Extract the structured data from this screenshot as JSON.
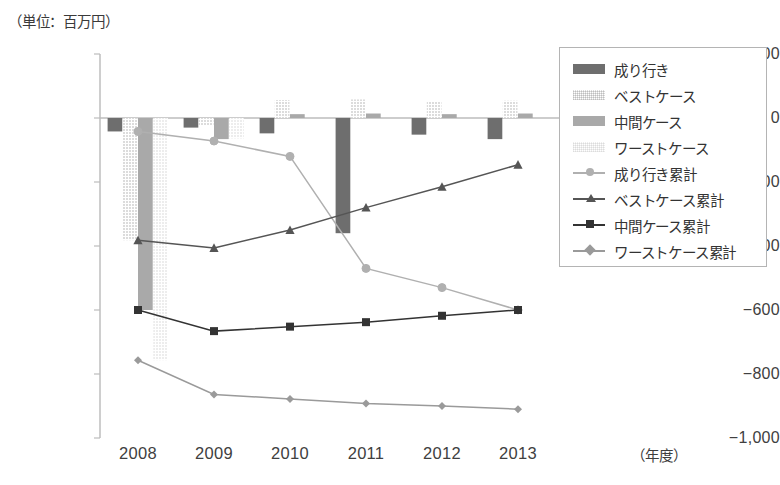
{
  "unit_label": "（単位：百万円）",
  "xaxis_unit": "（年度）",
  "legend": {
    "items": [
      {
        "label": "成り行き",
        "kind": "bar",
        "color": "#6e6e6e",
        "pattern": "solid"
      },
      {
        "label": "ベストケース",
        "kind": "bar",
        "color": "#dcdcdc",
        "pattern": "dotted"
      },
      {
        "label": "中間ケース",
        "kind": "bar",
        "color": "#a9a9a9",
        "pattern": "solid"
      },
      {
        "label": "ワーストケース",
        "kind": "bar",
        "color": "#ededed",
        "pattern": "dotted"
      },
      {
        "label": "成り行き累計",
        "kind": "line",
        "color": "#b0b0b0",
        "marker": "circle"
      },
      {
        "label": "ベストケース累計",
        "kind": "line",
        "color": "#555555",
        "marker": "triangle"
      },
      {
        "label": "中間ケース累計",
        "kind": "line",
        "color": "#333333",
        "marker": "square"
      },
      {
        "label": "ワーストケース累計",
        "kind": "line",
        "color": "#9a9a9a",
        "marker": "diamond"
      }
    ]
  },
  "chart_data": {
    "type": "bar",
    "title": "",
    "subtitle": "",
    "xlabel": "（年度）",
    "ylabel": "（単位：百万円）",
    "categories": [
      "2008",
      "2009",
      "2010",
      "2011",
      "2012",
      "2013"
    ],
    "ylim": [
      -1000,
      200
    ],
    "yticks": [
      200,
      0,
      -200,
      -400,
      -600,
      -800,
      -1000
    ],
    "ytick_labels": [
      "200",
      "0",
      "−200",
      "−400",
      "−600",
      "−800",
      "−1,000"
    ],
    "grid": false,
    "legend_position": "right",
    "series": [
      {
        "name": "成り行き",
        "type": "bar",
        "color": "#6e6e6e",
        "pattern": "solid",
        "values": [
          -42,
          -30,
          -48,
          -360,
          -52,
          -66
        ]
      },
      {
        "name": "ベストケース",
        "type": "bar",
        "color": "#dcdcdc",
        "pattern": "dotted",
        "values": [
          -382,
          -24,
          56,
          58,
          52,
          54
        ]
      },
      {
        "name": "中間ケース",
        "type": "bar",
        "color": "#a9a9a9",
        "pattern": "solid",
        "values": [
          -600,
          -66,
          12,
          14,
          12,
          14
        ]
      },
      {
        "name": "ワーストケース",
        "type": "bar",
        "color": "#ededed",
        "pattern": "dotted",
        "values": [
          -757,
          -64,
          0,
          0,
          0,
          0
        ]
      },
      {
        "name": "成り行き累計",
        "type": "line",
        "color": "#b0b0b0",
        "marker": "circle",
        "values": [
          -42,
          -72,
          -120,
          -470,
          -530,
          -600
        ]
      },
      {
        "name": "ベストケース累計",
        "type": "line",
        "color": "#555555",
        "marker": "triangle",
        "values": [
          -382,
          -406,
          -350,
          -280,
          -215,
          -146
        ]
      },
      {
        "name": "中間ケース累計",
        "type": "line",
        "color": "#333333",
        "marker": "square",
        "values": [
          -600,
          -666,
          -652,
          -638,
          -618,
          -600
        ]
      },
      {
        "name": "ワーストケース累計",
        "type": "line",
        "color": "#9a9a9a",
        "marker": "diamond",
        "values": [
          -757,
          -864,
          -878,
          -892,
          -900,
          -910
        ]
      }
    ]
  }
}
